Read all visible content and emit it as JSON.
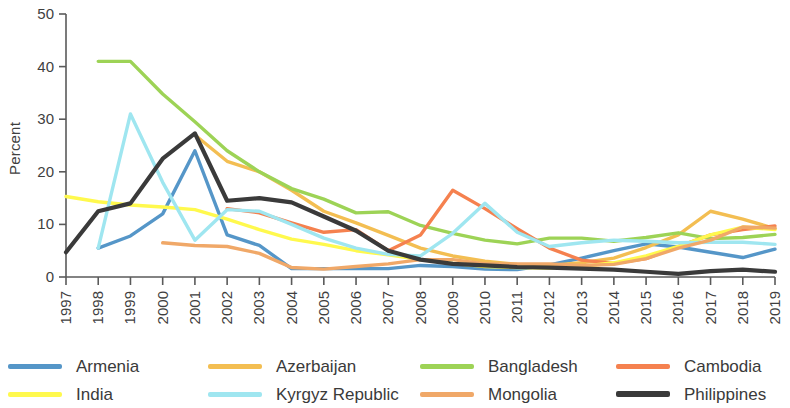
{
  "chart_data": {
    "type": "line",
    "title": "",
    "xlabel": "",
    "ylabel": "Percent",
    "ylim": [
      0,
      50
    ],
    "yticks": [
      0,
      10,
      20,
      30,
      40,
      50
    ],
    "grid": false,
    "legend_position": "bottom",
    "x": [
      1997,
      1998,
      1999,
      2000,
      2001,
      2002,
      2003,
      2004,
      2005,
      2006,
      2007,
      2008,
      2009,
      2010,
      2011,
      2012,
      2013,
      2014,
      2015,
      2016,
      2017,
      2018,
      2019
    ],
    "series": [
      {
        "name": "Armenia",
        "color": "#5596C8",
        "values": [
          null,
          5.5,
          7.8,
          12.0,
          24.0,
          8.0,
          6.0,
          1.6,
          1.6,
          1.6,
          1.6,
          2.2,
          2.0,
          1.5,
          1.4,
          2.3,
          3.6,
          5.0,
          6.3,
          5.7,
          4.7,
          3.7,
          5.3
        ]
      },
      {
        "name": "Azerbaijan",
        "color": "#F3BE52",
        "values": [
          null,
          null,
          null,
          null,
          27.0,
          22.0,
          20.0,
          16.5,
          12.5,
          10.3,
          7.9,
          5.5,
          4.0,
          3.0,
          2.4,
          2.2,
          2.7,
          3.6,
          5.6,
          8.0,
          12.5,
          11.0,
          9.2
        ]
      },
      {
        "name": "Bangladesh",
        "color": "#9DD356",
        "values": [
          null,
          41.0,
          41.0,
          34.8,
          29.5,
          24.0,
          20.0,
          16.8,
          14.8,
          12.2,
          12.4,
          9.8,
          8.3,
          7.0,
          6.3,
          7.4,
          7.4,
          6.8,
          7.5,
          8.4,
          7.3,
          7.5,
          8.1
        ]
      },
      {
        "name": "Cambodia",
        "color": "#F5814F",
        "values": [
          null,
          null,
          null,
          null,
          null,
          13.0,
          12.2,
          10.3,
          8.5,
          9.0,
          5.0,
          8.0,
          16.5,
          13.0,
          9.2,
          5.5,
          3.2,
          2.6,
          3.5,
          5.8,
          8.0,
          9.0,
          9.7
        ]
      },
      {
        "name": "India",
        "color": "#FFF94D",
        "values": [
          15.3,
          14.3,
          13.7,
          13.3,
          12.8,
          11.0,
          9.0,
          7.2,
          6.2,
          5.0,
          4.2,
          3.3,
          2.6,
          2.0,
          1.8,
          1.7,
          2.0,
          2.7,
          4.0,
          5.8,
          8.0,
          9.5,
          9.0
        ]
      },
      {
        "name": "Kyrgyz Republic",
        "color": "#9FE6F0",
        "values": [
          null,
          5.5,
          31.0,
          18.0,
          7.0,
          12.8,
          12.5,
          10.0,
          7.4,
          5.5,
          4.3,
          4.0,
          8.3,
          14.0,
          8.5,
          5.8,
          6.5,
          7.0,
          6.8,
          6.5,
          6.6,
          6.6,
          6.2
        ]
      },
      {
        "name": "Mongolia",
        "color": "#F0A868",
        "values": [
          null,
          null,
          null,
          6.5,
          6.0,
          5.8,
          4.5,
          1.8,
          1.5,
          2.0,
          2.5,
          3.3,
          3.3,
          2.5,
          2.5,
          2.5,
          2.2,
          2.4,
          3.5,
          5.5,
          7.0,
          9.5,
          9.3
        ]
      },
      {
        "name": "Philippines",
        "color": "#3A3A3A",
        "values": [
          4.7,
          12.5,
          14.0,
          22.5,
          27.3,
          14.5,
          15.0,
          14.2,
          11.5,
          8.8,
          5.0,
          3.3,
          2.5,
          2.2,
          1.9,
          1.8,
          1.6,
          1.4,
          1.0,
          0.6,
          1.1,
          1.4,
          1.0
        ]
      }
    ]
  },
  "legend": {
    "items": [
      {
        "label": "Armenia",
        "color": "#5596C8"
      },
      {
        "label": "Azerbaijan",
        "color": "#F3BE52"
      },
      {
        "label": "Bangladesh",
        "color": "#9DD356"
      },
      {
        "label": "Cambodia",
        "color": "#F5814F"
      },
      {
        "label": "India",
        "color": "#FFF94D"
      },
      {
        "label": "Kyrgyz Republic",
        "color": "#9FE6F0"
      },
      {
        "label": "Mongolia",
        "color": "#F0A868"
      },
      {
        "label": "Philippines",
        "color": "#3A3A3A"
      }
    ]
  }
}
